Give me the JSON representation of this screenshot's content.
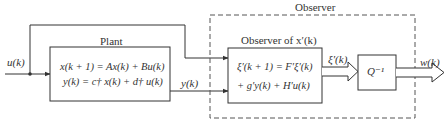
{
  "diagram": {
    "input_signal": "u(k)",
    "plant": {
      "title": "Plant",
      "eq1": "x(k + 1) = Ax(k) + Bu(k)",
      "eq2": "y(k) = c† x(k) + d† u(k)"
    },
    "output_signal": "y(k)",
    "observer_group": {
      "title": "Observer"
    },
    "observer_block": {
      "title": "Observer of x′(k)",
      "eq1": "ξ′(k + 1) = F′ξ′(k)",
      "eq2": "+ g′y(k) + H′u(k)"
    },
    "xi_signal": "ξ′(k)",
    "transform_block": {
      "label": "Q⁻¹"
    },
    "output_estimate": "w(k)",
    "colors": {
      "line": "#333333",
      "dashed": "#555555",
      "background": "#ffffff"
    }
  }
}
